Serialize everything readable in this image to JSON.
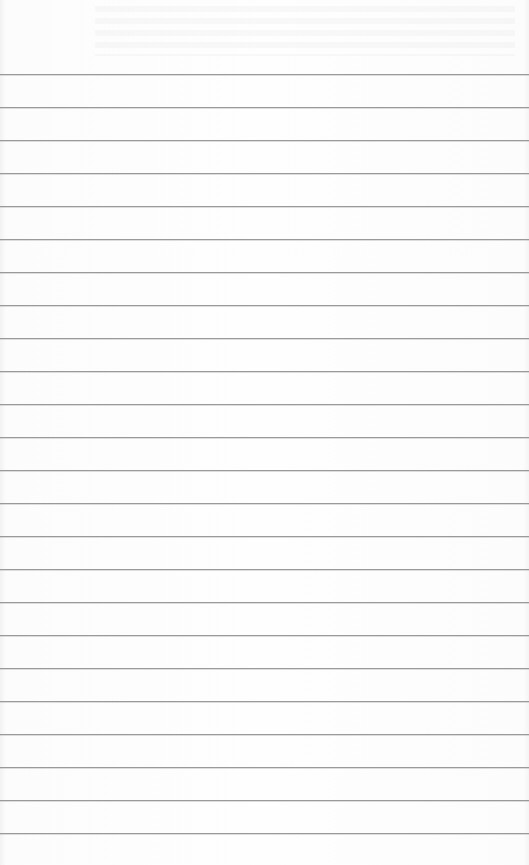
{
  "paper": {
    "type": "lined notebook paper",
    "line_color": "#9a9a9a",
    "background_color": "#fdfdfd",
    "first_line_y": 74,
    "line_spacing": 33,
    "line_count": 24
  }
}
